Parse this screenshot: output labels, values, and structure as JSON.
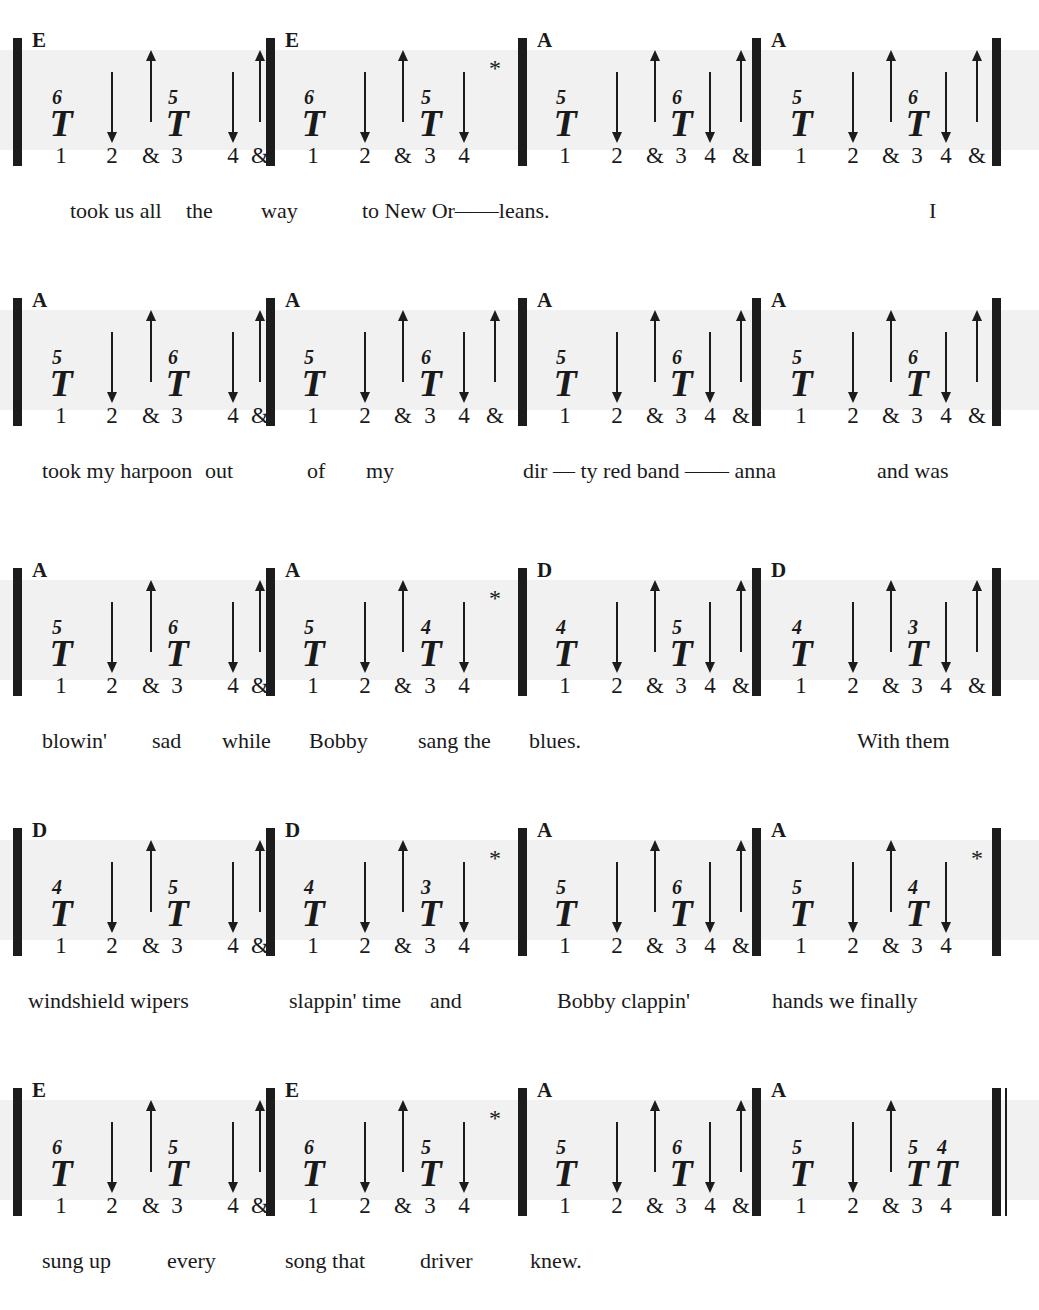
{
  "document": {
    "notation_type": "harmonica-tablature",
    "beats_per_measure": 4,
    "count_labels": [
      "1",
      "2",
      "&",
      "3",
      "4",
      "&"
    ],
    "symbols": {
      "tongue_block": "T",
      "draw_arrow": "down-arrow",
      "blow_arrow": "up-arrow",
      "asterisk": "*"
    }
  },
  "systems": [
    {
      "measures": [
        {
          "chord": "E",
          "events": [
            {
              "kind": "tnote",
              "hole": "6",
              "count": "1"
            },
            {
              "kind": "down",
              "count": "2"
            },
            {
              "kind": "up",
              "count": "&"
            },
            {
              "kind": "tnote",
              "hole": "5",
              "count": "3"
            },
            {
              "kind": "down",
              "count": "4"
            },
            {
              "kind": "up",
              "count": "&"
            }
          ]
        },
        {
          "chord": "E",
          "events": [
            {
              "kind": "tnote",
              "hole": "6",
              "count": "1"
            },
            {
              "kind": "down",
              "count": "2"
            },
            {
              "kind": "up",
              "count": "&"
            },
            {
              "kind": "tnote",
              "hole": "5",
              "count": "3"
            },
            {
              "kind": "down",
              "count": "4"
            },
            {
              "kind": "star",
              "count": ""
            }
          ]
        },
        {
          "chord": "A",
          "events": [
            {
              "kind": "tnote",
              "hole": "5",
              "count": "1"
            },
            {
              "kind": "down",
              "count": "2"
            },
            {
              "kind": "up",
              "count": "&"
            },
            {
              "kind": "tnote",
              "hole": "6",
              "count": "3"
            },
            {
              "kind": "down",
              "count": "4"
            },
            {
              "kind": "up",
              "count": "&"
            }
          ]
        },
        {
          "chord": "A",
          "events": [
            {
              "kind": "tnote",
              "hole": "5",
              "count": "1"
            },
            {
              "kind": "down",
              "count": "2"
            },
            {
              "kind": "up",
              "count": "&"
            },
            {
              "kind": "tnote",
              "hole": "6",
              "count": "3"
            },
            {
              "kind": "down",
              "count": "4"
            },
            {
              "kind": "up",
              "count": "&"
            }
          ]
        }
      ],
      "lyrics": [
        {
          "text": "took us all",
          "x": 70
        },
        {
          "text": "the",
          "x": 186
        },
        {
          "text": "way",
          "x": 261
        },
        {
          "text": "to New Or——leans.",
          "x": 362
        },
        {
          "text": "I",
          "x": 929
        }
      ]
    },
    {
      "measures": [
        {
          "chord": "A",
          "events": [
            {
              "kind": "tnote",
              "hole": "5",
              "count": "1"
            },
            {
              "kind": "down",
              "count": "2"
            },
            {
              "kind": "up",
              "count": "&"
            },
            {
              "kind": "tnote",
              "hole": "6",
              "count": "3"
            },
            {
              "kind": "down",
              "count": "4"
            },
            {
              "kind": "up",
              "count": "&"
            }
          ]
        },
        {
          "chord": "A",
          "events": [
            {
              "kind": "tnote",
              "hole": "5",
              "count": "1"
            },
            {
              "kind": "down",
              "count": "2"
            },
            {
              "kind": "up",
              "count": "&"
            },
            {
              "kind": "tnote",
              "hole": "6",
              "count": "3"
            },
            {
              "kind": "down",
              "count": "4"
            },
            {
              "kind": "up",
              "count": "&"
            }
          ]
        },
        {
          "chord": "A",
          "events": [
            {
              "kind": "tnote",
              "hole": "5",
              "count": "1"
            },
            {
              "kind": "down",
              "count": "2"
            },
            {
              "kind": "up",
              "count": "&"
            },
            {
              "kind": "tnote",
              "hole": "6",
              "count": "3"
            },
            {
              "kind": "down",
              "count": "4"
            },
            {
              "kind": "up",
              "count": "&"
            }
          ]
        },
        {
          "chord": "A",
          "events": [
            {
              "kind": "tnote",
              "hole": "5",
              "count": "1"
            },
            {
              "kind": "down",
              "count": "2"
            },
            {
              "kind": "up",
              "count": "&"
            },
            {
              "kind": "tnote",
              "hole": "6",
              "count": "3"
            },
            {
              "kind": "down",
              "count": "4"
            },
            {
              "kind": "up",
              "count": "&"
            }
          ]
        }
      ],
      "lyrics": [
        {
          "text": "took my  harpoon",
          "x": 42
        },
        {
          "text": "out",
          "x": 205
        },
        {
          "text": "of",
          "x": 307
        },
        {
          "text": "my",
          "x": 366
        },
        {
          "text": "dir — ty   red  band —— anna",
          "x": 523
        },
        {
          "text": "and was",
          "x": 877
        }
      ]
    },
    {
      "measures": [
        {
          "chord": "A",
          "events": [
            {
              "kind": "tnote",
              "hole": "5",
              "count": "1"
            },
            {
              "kind": "down",
              "count": "2"
            },
            {
              "kind": "up",
              "count": "&"
            },
            {
              "kind": "tnote",
              "hole": "6",
              "count": "3"
            },
            {
              "kind": "down",
              "count": "4"
            },
            {
              "kind": "up",
              "count": "&"
            }
          ]
        },
        {
          "chord": "A",
          "events": [
            {
              "kind": "tnote",
              "hole": "5",
              "count": "1"
            },
            {
              "kind": "down",
              "count": "2"
            },
            {
              "kind": "up",
              "count": "&"
            },
            {
              "kind": "tnote",
              "hole": "4",
              "count": "3"
            },
            {
              "kind": "down",
              "count": "4"
            },
            {
              "kind": "star",
              "count": ""
            }
          ]
        },
        {
          "chord": "D",
          "events": [
            {
              "kind": "tnote",
              "hole": "4",
              "count": "1"
            },
            {
              "kind": "down",
              "count": "2"
            },
            {
              "kind": "up",
              "count": "&"
            },
            {
              "kind": "tnote",
              "hole": "5",
              "count": "3"
            },
            {
              "kind": "down",
              "count": "4"
            },
            {
              "kind": "up",
              "count": "&"
            }
          ]
        },
        {
          "chord": "D",
          "events": [
            {
              "kind": "tnote",
              "hole": "4",
              "count": "1"
            },
            {
              "kind": "down",
              "count": "2"
            },
            {
              "kind": "up",
              "count": "&"
            },
            {
              "kind": "tnote",
              "hole": "3",
              "count": "3"
            },
            {
              "kind": "down",
              "count": "4"
            },
            {
              "kind": "up",
              "count": "&"
            }
          ]
        }
      ],
      "lyrics": [
        {
          "text": "blowin'",
          "x": 42
        },
        {
          "text": "sad",
          "x": 152
        },
        {
          "text": "while",
          "x": 222
        },
        {
          "text": "Bobby",
          "x": 309
        },
        {
          "text": "sang the",
          "x": 418
        },
        {
          "text": "blues.",
          "x": 529
        },
        {
          "text": "With them",
          "x": 857
        }
      ]
    },
    {
      "measures": [
        {
          "chord": "D",
          "events": [
            {
              "kind": "tnote",
              "hole": "4",
              "count": "1"
            },
            {
              "kind": "down",
              "count": "2"
            },
            {
              "kind": "up",
              "count": "&"
            },
            {
              "kind": "tnote",
              "hole": "5",
              "count": "3"
            },
            {
              "kind": "down",
              "count": "4"
            },
            {
              "kind": "up",
              "count": "&"
            }
          ]
        },
        {
          "chord": "D",
          "events": [
            {
              "kind": "tnote",
              "hole": "4",
              "count": "1"
            },
            {
              "kind": "down",
              "count": "2"
            },
            {
              "kind": "up",
              "count": "&"
            },
            {
              "kind": "tnote",
              "hole": "3",
              "count": "3"
            },
            {
              "kind": "down",
              "count": "4"
            },
            {
              "kind": "star",
              "count": ""
            }
          ]
        },
        {
          "chord": "A",
          "events": [
            {
              "kind": "tnote",
              "hole": "5",
              "count": "1"
            },
            {
              "kind": "down",
              "count": "2"
            },
            {
              "kind": "up",
              "count": "&"
            },
            {
              "kind": "tnote",
              "hole": "6",
              "count": "3"
            },
            {
              "kind": "down",
              "count": "4"
            },
            {
              "kind": "up",
              "count": "&"
            }
          ]
        },
        {
          "chord": "A",
          "events": [
            {
              "kind": "tnote",
              "hole": "5",
              "count": "1"
            },
            {
              "kind": "down",
              "count": "2"
            },
            {
              "kind": "up",
              "count": "&"
            },
            {
              "kind": "tnote",
              "hole": "4",
              "count": "3"
            },
            {
              "kind": "down",
              "count": "4"
            },
            {
              "kind": "star",
              "count": ""
            }
          ]
        }
      ],
      "lyrics": [
        {
          "text": "windshield wipers",
          "x": 28
        },
        {
          "text": "slappin' time",
          "x": 289
        },
        {
          "text": "and",
          "x": 430
        },
        {
          "text": "Bobby clappin'",
          "x": 557
        },
        {
          "text": "hands we  finally",
          "x": 772
        }
      ]
    },
    {
      "measures": [
        {
          "chord": "E",
          "events": [
            {
              "kind": "tnote",
              "hole": "6",
              "count": "1"
            },
            {
              "kind": "down",
              "count": "2"
            },
            {
              "kind": "up",
              "count": "&"
            },
            {
              "kind": "tnote",
              "hole": "5",
              "count": "3"
            },
            {
              "kind": "down",
              "count": "4"
            },
            {
              "kind": "up",
              "count": "&"
            }
          ]
        },
        {
          "chord": "E",
          "events": [
            {
              "kind": "tnote",
              "hole": "6",
              "count": "1"
            },
            {
              "kind": "down",
              "count": "2"
            },
            {
              "kind": "up",
              "count": "&"
            },
            {
              "kind": "tnote",
              "hole": "5",
              "count": "3"
            },
            {
              "kind": "down",
              "count": "4"
            },
            {
              "kind": "star",
              "count": ""
            }
          ]
        },
        {
          "chord": "A",
          "events": [
            {
              "kind": "tnote",
              "hole": "5",
              "count": "1"
            },
            {
              "kind": "down",
              "count": "2"
            },
            {
              "kind": "up",
              "count": "&"
            },
            {
              "kind": "tnote",
              "hole": "6",
              "count": "3"
            },
            {
              "kind": "down",
              "count": "4"
            },
            {
              "kind": "up",
              "count": "&"
            }
          ]
        },
        {
          "chord": "A",
          "events": [
            {
              "kind": "tnote",
              "hole": "5",
              "count": "1"
            },
            {
              "kind": "down",
              "count": "2"
            },
            {
              "kind": "up",
              "count": "&"
            },
            {
              "kind": "tnote",
              "hole": "5",
              "count": "3"
            },
            {
              "kind": "tnote",
              "hole": "4",
              "count": "4"
            }
          ],
          "final": true
        }
      ],
      "lyrics": [
        {
          "text": "sung up",
          "x": 42
        },
        {
          "text": "every",
          "x": 167
        },
        {
          "text": "song that",
          "x": 285
        },
        {
          "text": "driver",
          "x": 420
        },
        {
          "text": "knew.",
          "x": 530
        }
      ]
    }
  ]
}
